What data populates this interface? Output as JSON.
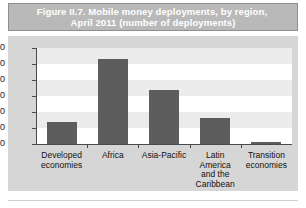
{
  "figure": {
    "title_line_1": "Figure II.7.   Mobile money deployments, by region,",
    "title_line_2": "April 2011 (number of deployments)",
    "title_band_color": "#b9b9b9",
    "title_text_color": "#ffffff"
  },
  "colors": {
    "bar": "#5d5d5d",
    "plot_background": "#ffffff",
    "band": "#ececec",
    "frame": "#d6d6d6",
    "axis": "#4a4a4a"
  },
  "chart_data": {
    "type": "bar",
    "title": "Figure II.7.   Mobile money deployments, by region, April 2011 (number of deployments)",
    "categories": [
      "Developed\neconomies",
      "Africa",
      "Asia-Pacific",
      "Latin\nAmerica\nand the\nCaribbean",
      "Transition\neconomies"
    ],
    "values": [
      14,
      53,
      34,
      16,
      1
    ],
    "xlabel": "",
    "ylabel": "",
    "ylim": [
      0,
      60
    ],
    "yticks": [
      0,
      10,
      20,
      30,
      40,
      50,
      60
    ],
    "ytick_labels": [
      "0",
      "10",
      "20",
      "30",
      "40",
      "50",
      "60"
    ],
    "grid": false,
    "banded_background": true,
    "legend": false
  }
}
